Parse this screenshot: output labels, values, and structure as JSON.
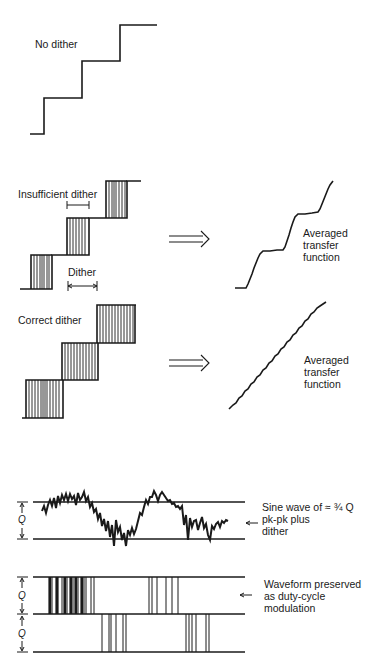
{
  "panels": {
    "no_dither": {
      "label": "No dither"
    },
    "insufficient_dither": {
      "label": "Insufficient dither",
      "dither_label": "Dither",
      "arrow": "double-arrow-right",
      "result_label_lines": [
        "Averaged",
        "transfer",
        "function"
      ]
    },
    "correct_dither": {
      "label": "Correct dither",
      "arrow": "double-arrow-right",
      "result_label_lines": [
        "Averaged",
        "transfer",
        "function"
      ]
    },
    "sine_wave": {
      "q_label": "Q",
      "caption_lines": [
        "Sine wave of ≈ ¾ Q",
        "pk-pk plus",
        "dither"
      ]
    },
    "duty_cycle": {
      "q_label_top": "Q",
      "q_label_bottom": "Q",
      "caption_lines": [
        "Waveform preserved",
        "as duty-cycle",
        "modulation"
      ]
    }
  },
  "colors": {
    "ink": "#1a1a1a",
    "background": "#ffffff"
  }
}
